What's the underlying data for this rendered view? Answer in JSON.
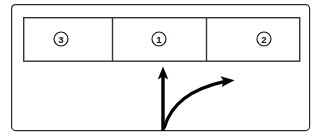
{
  "diagram": {
    "background_color": "#ffffff",
    "line_color": "#111111",
    "frame": {
      "name": "outer-frame",
      "x": 11,
      "y": 4,
      "width": 299,
      "height": 127,
      "corner_radius": 4,
      "stroke_color": "#2b2b2b"
    },
    "table": {
      "name": "three-cell-table",
      "x": 23,
      "y": 17,
      "width": 277,
      "height": 44,
      "stroke_color": "#333333",
      "column_dividers_x": [
        112,
        206
      ],
      "cells": [
        {
          "id": "cell-left",
          "marker_label": "3",
          "marker_shape": "circle",
          "center_x": 61,
          "center_y": 39,
          "radius": 7
        },
        {
          "id": "cell-middle",
          "marker_label": "1",
          "marker_shape": "circle",
          "center_x": 159,
          "center_y": 39,
          "radius": 7
        },
        {
          "id": "cell-right",
          "marker_label": "2",
          "marker_shape": "circle",
          "center_x": 264,
          "center_y": 39,
          "radius": 7
        }
      ]
    },
    "arrows": [
      {
        "id": "vertical-up-arrow",
        "name": "vertical-up-arrow",
        "direction": "up",
        "shape": "straight",
        "start_x": 163,
        "start_y": 131,
        "end_x": 163,
        "end_y": 67,
        "head_width": 11,
        "head_length": 11,
        "stroke_width": 3.4,
        "color": "#000000"
      },
      {
        "id": "curved-right-arrow",
        "name": "curved-right-arrow",
        "direction": "right",
        "shape": "curved",
        "start_x": 164,
        "start_y": 126,
        "control_x": 196,
        "control_y": 118,
        "end_x": 226,
        "end_y": 81,
        "head_x": 234,
        "head_y": 80,
        "head_width": 11,
        "head_length": 12,
        "stroke_width": 3.2,
        "color": "#000000"
      }
    ]
  }
}
